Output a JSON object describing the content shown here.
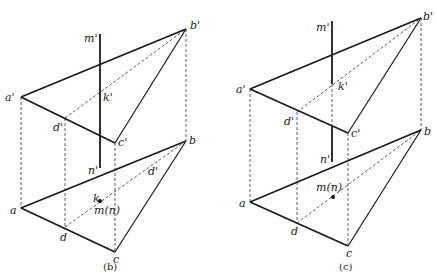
{
  "figures": [
    {
      "caption": "(b)",
      "labels": {
        "b_prime": "b'",
        "a_prime": "a'",
        "c_prime": "c'",
        "d_prime": "d'",
        "m_prime": "m'",
        "k_prime": "k'",
        "n_prime": "n'",
        "a": "a",
        "b": "b",
        "c": "c",
        "d": "d",
        "k": "k",
        "mn": "m(n)",
        "d_prime_plan": "d'"
      }
    },
    {
      "caption": "(c)",
      "labels": {
        "b_prime": "b'",
        "a_prime": "a'",
        "c_prime": "c'",
        "d_prime": "d'",
        "m_prime": "m'",
        "k_prime": "k'",
        "n_prime": "n'",
        "a": "a",
        "b": "b",
        "c": "c",
        "d": "d",
        "mn": "m(n)"
      }
    }
  ]
}
